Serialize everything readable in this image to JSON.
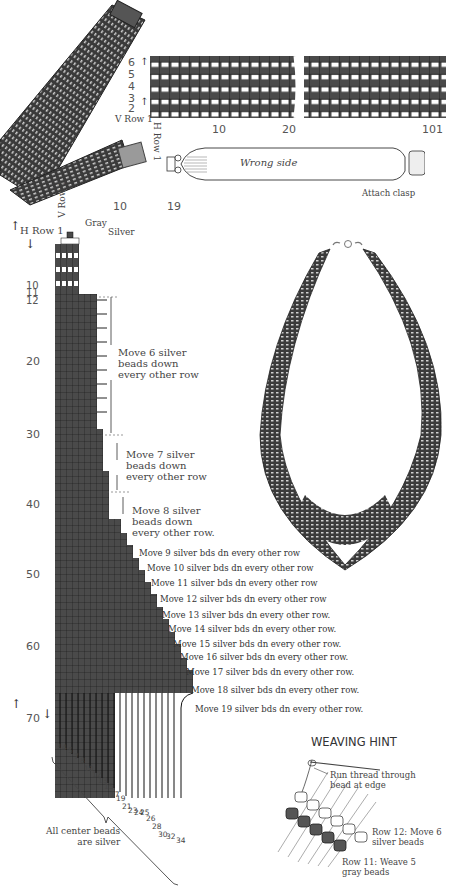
{
  "top_pattern": {
    "row_labels": [
      "6",
      "5",
      "4",
      "3",
      "2",
      "V Row 1"
    ],
    "col_labels": [
      "10",
      "20",
      "101"
    ],
    "h_row_label": "H Row 1",
    "wrong_side_label": "Wrong side",
    "attach_clasp_label": "Attach clasp"
  },
  "side_pattern": {
    "v_row_label": "V Row 1",
    "col_labels": [
      "10",
      "19"
    ],
    "gray_label": "Gray",
    "silver_label": "Silver",
    "h_row_label": "H Row 1",
    "row_numbers": [
      "10",
      "11",
      "12",
      "20",
      "30",
      "40",
      "50",
      "60",
      "70"
    ],
    "instructions": [
      {
        "text": "Move 6 silver beads down every other row",
        "lines": [
          "Move 6 silver",
          "beads down",
          "every other row"
        ]
      },
      {
        "text": "Move 7 silver beads down every other row",
        "lines": [
          "Move 7 silver",
          "beads down",
          "every other row"
        ]
      },
      {
        "text": "Move 8 silver beads down every other row.",
        "lines": [
          "Move 8 silver",
          "beads down",
          "every other row."
        ]
      },
      {
        "text": "Move 9 silver bds dn every other  row"
      },
      {
        "text": "Move 10 silver bds dn every other row"
      },
      {
        "text": "Move 11 silver bds dn every other row"
      },
      {
        "text": "Move 12 silver bds dn every other row"
      },
      {
        "text": "Move 13 silver bds dn every other row."
      },
      {
        "text": "Move 14 silver bds dn every other row."
      },
      {
        "text": "Move 15 silver bds dn every other row."
      },
      {
        "text": "Move 16 silver bds dn every other row."
      },
      {
        "text": "Move 17 silver bds dn every other row."
      },
      {
        "text": "Move 18 silver bds dn every other row."
      },
      {
        "text": "Move 19 silver bds dn every other row."
      }
    ],
    "fringe_numbers": [
      "3",
      "4",
      "5",
      "7",
      "8",
      "10",
      "12",
      "13",
      "15",
      "17",
      "19",
      "21",
      "23",
      "24",
      "25",
      "26",
      "28",
      "30",
      "32",
      "34"
    ],
    "center_note": [
      "All center beads",
      "are silver"
    ]
  },
  "weaving_hint": {
    "title": "WEAVING HINT",
    "callout_1": [
      "Run thread through",
      "bead at edge"
    ],
    "callout_2": [
      "Row 12:  Move 6",
      "silver beads"
    ],
    "callout_3": [
      "Row 11:  Weave 5",
      "gray beads"
    ]
  },
  "colors": {
    "gray_bead": "#4a4a4a",
    "silver_bead": "#ffffff",
    "grid_line": "#222222"
  }
}
